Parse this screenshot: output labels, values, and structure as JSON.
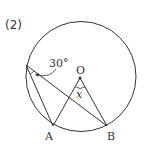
{
  "problem": {
    "number_label": "(2)"
  },
  "figure": {
    "circle": {
      "cx": 81,
      "cy": 76.5,
      "r": 55
    },
    "points": {
      "O": {
        "label": "O",
        "x": 80,
        "y": 78
      },
      "A": {
        "label": "A",
        "x": 53,
        "y": 126
      },
      "B": {
        "label": "B",
        "x": 107,
        "y": 126
      },
      "P": {
        "label": "",
        "x": 26,
        "y": 65
      }
    },
    "angles": {
      "given": {
        "label": "30°",
        "vertex": "P"
      },
      "unknown": {
        "label": "x",
        "vertex": "O"
      }
    },
    "colors": {
      "stroke": "#333333",
      "background": "#ffffff"
    }
  }
}
